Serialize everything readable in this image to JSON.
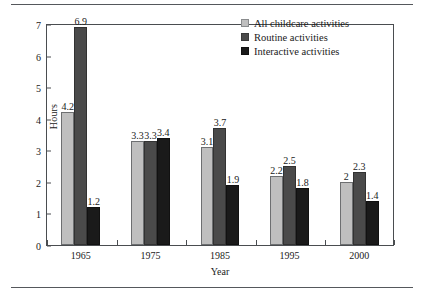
{
  "chart_data": {
    "type": "bar",
    "title": "",
    "xlabel": "Year",
    "ylabel": "Hours",
    "categories": [
      "1965",
      "1975",
      "1985",
      "1995",
      "2000"
    ],
    "ylim": [
      0,
      7
    ],
    "yticks": [
      "0",
      "1",
      "2",
      "3",
      "4",
      "5",
      "6",
      "7"
    ],
    "grid": false,
    "legend_position": "top-right",
    "series": [
      {
        "name": "All childcare activities",
        "color": "#bfbfbf",
        "values": [
          4.2,
          3.3,
          3.1,
          2.2,
          2
        ],
        "labels": [
          "4.2",
          "3.3",
          "3.1",
          "2.2",
          "2"
        ]
      },
      {
        "name": "Routine activities",
        "color": "#4a4a4a",
        "values": [
          6.9,
          3.3,
          3.7,
          2.5,
          2.3
        ],
        "labels": [
          "6.9",
          "3.3",
          "3.7",
          "2.5",
          "2.3"
        ]
      },
      {
        "name": "Interactive activities",
        "color": "#1a1a1a",
        "values": [
          1.2,
          3.4,
          1.9,
          1.8,
          1.4
        ],
        "labels": [
          "1.2",
          "3.4",
          "1.9",
          "1.8",
          "1.4"
        ]
      }
    ]
  }
}
